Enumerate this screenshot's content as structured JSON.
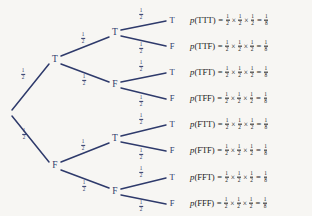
{
  "diagram": {
    "edge_color": "#2e3a6b",
    "background": "#f7f6f3",
    "branch_probability": {
      "numerator": "1",
      "denominator": "2"
    },
    "root": {
      "label": "",
      "x": 10,
      "y": 113
    },
    "nodes": [
      {
        "id": "t",
        "label": "T",
        "x": 55,
        "y": 60,
        "level": 1
      },
      {
        "id": "f",
        "label": "F",
        "x": 55,
        "y": 166,
        "level": 1
      },
      {
        "id": "tt",
        "label": "T",
        "x": 115,
        "y": 33,
        "level": 2
      },
      {
        "id": "tf",
        "label": "F",
        "x": 115,
        "y": 85,
        "level": 2
      },
      {
        "id": "ft",
        "label": "T",
        "x": 115,
        "y": 139,
        "level": 2
      },
      {
        "id": "ff",
        "label": "F",
        "x": 115,
        "y": 192,
        "level": 2
      }
    ],
    "leaves": [
      {
        "label": "T",
        "x": 172,
        "y": 20
      },
      {
        "label": "F",
        "x": 172,
        "y": 46
      },
      {
        "label": "T",
        "x": 172,
        "y": 72
      },
      {
        "label": "F",
        "x": 172,
        "y": 98
      },
      {
        "label": "T",
        "x": 172,
        "y": 124
      },
      {
        "label": "F",
        "x": 172,
        "y": 150
      },
      {
        "label": "T",
        "x": 172,
        "y": 177
      },
      {
        "label": "F",
        "x": 172,
        "y": 203
      }
    ],
    "edges": [
      {
        "from": "root",
        "to": "t",
        "x1": 12,
        "y1": 110,
        "x2": 49,
        "y2": 64,
        "label_x": 23,
        "label_y": 74
      },
      {
        "from": "root",
        "to": "f",
        "x1": 12,
        "y1": 116,
        "x2": 49,
        "y2": 162,
        "label_x": 24,
        "label_y": 134
      },
      {
        "from": "t",
        "to": "tt",
        "x1": 61,
        "y1": 56,
        "x2": 109,
        "y2": 37,
        "label_x": 83,
        "label_y": 38
      },
      {
        "from": "t",
        "to": "tf",
        "x1": 61,
        "y1": 64,
        "x2": 109,
        "y2": 82,
        "label_x": 84,
        "label_y": 80
      },
      {
        "from": "f",
        "to": "ft",
        "x1": 61,
        "y1": 162,
        "x2": 109,
        "y2": 143,
        "label_x": 83,
        "label_y": 145
      },
      {
        "from": "f",
        "to": "ff",
        "x1": 61,
        "y1": 170,
        "x2": 109,
        "y2": 188,
        "label_x": 84,
        "label_y": 186
      },
      {
        "from": "tt",
        "to": "l0",
        "x1": 121,
        "y1": 30,
        "x2": 166,
        "y2": 21,
        "label_x": 141,
        "label_y": 14
      },
      {
        "from": "tt",
        "to": "l1",
        "x1": 121,
        "y1": 36,
        "x2": 166,
        "y2": 46,
        "label_x": 141,
        "label_y": 48
      },
      {
        "from": "tf",
        "to": "l2",
        "x1": 121,
        "y1": 82,
        "x2": 166,
        "y2": 73,
        "label_x": 141,
        "label_y": 66
      },
      {
        "from": "tf",
        "to": "l3",
        "x1": 121,
        "y1": 88,
        "x2": 166,
        "y2": 99,
        "label_x": 141,
        "label_y": 101
      },
      {
        "from": "ft",
        "to": "l4",
        "x1": 121,
        "y1": 136,
        "x2": 166,
        "y2": 125,
        "label_x": 141,
        "label_y": 119
      },
      {
        "from": "ft",
        "to": "l5",
        "x1": 121,
        "y1": 142,
        "x2": 166,
        "y2": 151,
        "label_x": 141,
        "label_y": 154
      },
      {
        "from": "ff",
        "to": "l6",
        "x1": 121,
        "y1": 189,
        "x2": 166,
        "y2": 178,
        "label_x": 141,
        "label_y": 172
      },
      {
        "from": "ff",
        "to": "l7",
        "x1": 121,
        "y1": 195,
        "x2": 166,
        "y2": 204,
        "label_x": 141,
        "label_y": 206
      }
    ],
    "equations": [
      {
        "outcome": "TTT",
        "y": 20,
        "factors": [
          "1/2",
          "1/2",
          "1/2"
        ],
        "result_num": "1",
        "result_den": "8"
      },
      {
        "outcome": "TTF",
        "y": 46,
        "factors": [
          "1/2",
          "1/2",
          "1/2"
        ],
        "result_num": "1",
        "result_den": "8"
      },
      {
        "outcome": "TFT",
        "y": 72,
        "factors": [
          "1/2",
          "1/2",
          "1/2"
        ],
        "result_num": "1",
        "result_den": "8"
      },
      {
        "outcome": "TFF",
        "y": 98,
        "factors": [
          "1/2",
          "1/2",
          "1/2"
        ],
        "result_num": "1",
        "result_den": "8"
      },
      {
        "outcome": "FTT",
        "y": 124,
        "factors": [
          "1/2",
          "1/2",
          "1/2"
        ],
        "result_num": "1",
        "result_den": "8"
      },
      {
        "outcome": "FTF",
        "y": 150,
        "factors": [
          "1/2",
          "1/2",
          "1/2"
        ],
        "result_num": "1",
        "result_den": "8"
      },
      {
        "outcome": "FFT",
        "y": 177,
        "factors": [
          "1/2",
          "1/2",
          "1/2"
        ],
        "result_num": "1",
        "result_den": "8"
      },
      {
        "outcome": "FFF",
        "y": 203,
        "factors": [
          "1/2",
          "1/2",
          "1/2"
        ],
        "result_num": "1",
        "result_den": "8"
      }
    ],
    "symbols": {
      "probability_function": "p",
      "times": "×",
      "equals": "=",
      "open_paren": "(",
      "close_paren": ")"
    },
    "equation_left": 190
  }
}
